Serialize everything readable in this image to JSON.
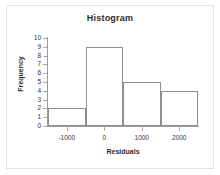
{
  "chart_data": {
    "type": "bar",
    "title": "Histogram",
    "xlabel": "Residuals",
    "ylabel": "Frequency",
    "categories": [
      "-1500 to -500",
      "-500 to 500",
      "500 to 1500",
      "1500 to 2500"
    ],
    "values": [
      2,
      9,
      5,
      4
    ],
    "bin_edges": [
      -1500,
      -500,
      500,
      1500,
      2500
    ],
    "bin_width": 1000,
    "xlim": [
      -1500,
      2500
    ],
    "ylim": [
      0,
      10
    ],
    "x_ticks": [
      -1000,
      0,
      1000,
      2000
    ],
    "x_tick_labels": [
      "-1000",
      "0",
      "1000",
      "2000"
    ],
    "y_ticks": [
      0,
      1,
      2,
      3,
      4,
      5,
      6,
      7,
      8,
      9,
      10
    ],
    "y_tick_labels": [
      "0",
      "1",
      "2",
      "3",
      "4",
      "5",
      "6",
      "7",
      "8",
      "9",
      "10"
    ],
    "grid": false,
    "legend": null,
    "bar_fill_color": "#ffffff",
    "bar_edge_color": "#8f8f8f",
    "axis_color": "#9a9a9a",
    "text_color": "#2b2b2b",
    "background_color": "#ffffff",
    "frame_color": "#e2e2e2"
  }
}
